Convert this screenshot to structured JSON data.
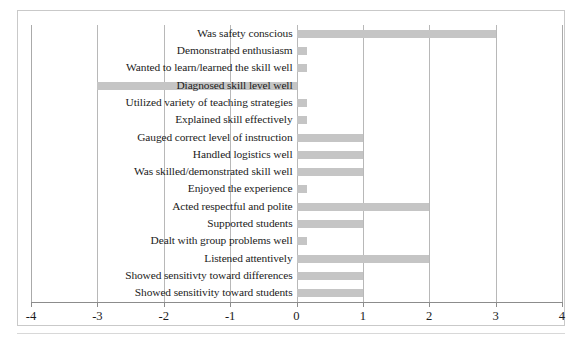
{
  "chart_data": {
    "type": "bar",
    "orientation": "horizontal",
    "title": "",
    "subtitle": "",
    "xlabel": "",
    "ylabel": "",
    "xlim": [
      -4,
      4
    ],
    "xticks": [
      -4,
      -3,
      -2,
      -1,
      0,
      1,
      2,
      3,
      4
    ],
    "xtick_labels": [
      "-4",
      "-3",
      "-2",
      "-1",
      "0",
      "1",
      "2",
      "3",
      "4"
    ],
    "grid": true,
    "grid_axis": "x",
    "legend": false,
    "legend_position": "none",
    "bar_color": "#c5c5c5",
    "categories": [
      "Was safety conscious",
      "Demonstrated enthusiasm",
      "Wanted to learn/learned the skill well",
      "Diagnosed skill level well",
      "Utilized variety of teaching strategies",
      "Explained skill effectively",
      "Gauged correct level of instruction",
      "Handled logistics well",
      "Was skilled/demonstrated skill well",
      "Enjoyed the experience",
      "Acted respectful and polite",
      "Supported students",
      "Dealt with group problems well",
      "Listened attentively",
      "Showed sensitivty toward differences",
      "Showed sensitivity toward students"
    ],
    "values": [
      3,
      0,
      0,
      -3,
      0,
      0,
      1,
      1,
      1,
      0,
      2,
      1,
      0,
      2,
      1,
      1
    ]
  }
}
